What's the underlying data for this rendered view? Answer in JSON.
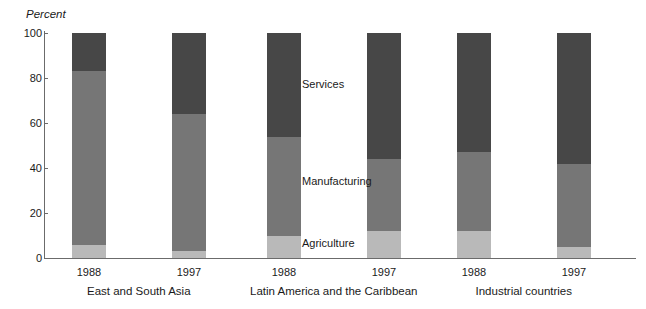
{
  "chart_data": {
    "type": "bar",
    "subtype": "stacked-column",
    "title": "",
    "xlabel": "",
    "ylabel": "Percent",
    "ylim": [
      0,
      100
    ],
    "yticks": [
      0,
      20,
      40,
      60,
      80,
      100
    ],
    "ytick_labels": [
      "0",
      "20",
      "40",
      "60",
      "80",
      "100"
    ],
    "grid": false,
    "legend": "inline-annotations",
    "stack_order_bottom_to_top": [
      "Agriculture",
      "Manufacturing",
      "Services"
    ],
    "groups": [
      {
        "name": "East and South Asia",
        "categories": [
          "1988",
          "1997"
        ]
      },
      {
        "name": "Latin America and the Caribbean",
        "categories": [
          "1988",
          "1997"
        ]
      },
      {
        "name": "Industrial countries",
        "categories": [
          "1988",
          "1997"
        ]
      }
    ],
    "categories": [
      "1988",
      "1997",
      "1988",
      "1997",
      "1988",
      "1997"
    ],
    "series": [
      {
        "name": "Agriculture",
        "color": "#b9b9b9",
        "values": [
          6,
          3,
          10,
          12,
          12,
          5
        ]
      },
      {
        "name": "Manufacturing",
        "color": "#767676",
        "values": [
          77,
          61,
          44,
          32,
          35,
          37
        ]
      },
      {
        "name": "Services",
        "color": "#474747",
        "values": [
          17,
          36,
          46,
          56,
          53,
          58
        ]
      }
    ],
    "bars": [
      {
        "group": "East and South Asia",
        "year": "1988",
        "agriculture": 6,
        "manufacturing": 77,
        "services": 17
      },
      {
        "group": "East and South Asia",
        "year": "1997",
        "agriculture": 3,
        "manufacturing": 61,
        "services": 36
      },
      {
        "group": "Latin America and the Caribbean",
        "year": "1988",
        "agriculture": 10,
        "manufacturing": 44,
        "services": 46
      },
      {
        "group": "Latin America and the Caribbean",
        "year": "1997",
        "agriculture": 12,
        "manufacturing": 32,
        "services": 56
      },
      {
        "group": "Industrial countries",
        "year": "1988",
        "agriculture": 12,
        "manufacturing": 35,
        "services": 53
      },
      {
        "group": "Industrial countries",
        "year": "1997",
        "agriculture": 5,
        "manufacturing": 37,
        "services": 58
      }
    ]
  },
  "axis": {
    "y_title": "Percent",
    "ticks": [
      {
        "label": "100",
        "value": 100
      },
      {
        "label": "80",
        "value": 80
      },
      {
        "label": "60",
        "value": 60
      },
      {
        "label": "40",
        "value": 40
      },
      {
        "label": "20",
        "value": 20
      },
      {
        "label": "0",
        "value": 0
      }
    ]
  },
  "annotations": {
    "services": "Services",
    "manufacturing": "Manufacturing",
    "agriculture": "Agriculture"
  },
  "x_labels": {
    "years": [
      "1988",
      "1997",
      "1988",
      "1997",
      "1988",
      "1997"
    ],
    "groups": [
      "East and South Asia",
      "Latin America and the Caribbean",
      "Industrial countries"
    ]
  },
  "colors": {
    "services": "#474747",
    "manufacturing": "#767676",
    "agriculture": "#b9b9b9",
    "axis": "#6b6b6b",
    "text": "#1a1a1a",
    "background": "#ffffff"
  }
}
